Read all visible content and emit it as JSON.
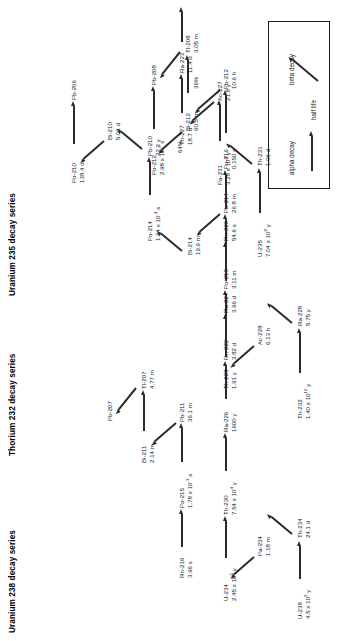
{
  "figure": {
    "orientation": "landscape-figure-rotated-90ccw",
    "background": "#ffffff",
    "line_color": "#2b2b2b",
    "text_color": "#1a1a1a"
  },
  "series": [
    {
      "id": "u238",
      "title": "Uranium 238 decay series",
      "nodes": [
        {
          "name": "U-238",
          "half_life": "4.5 x 10",
          "exp": "9",
          "unit": "y"
        },
        {
          "name": "Th-234",
          "half_life": "24.1 d"
        },
        {
          "name": "Pa-234",
          "half_life": "1.18 m"
        },
        {
          "name": "U-234",
          "half_life": "2.45 x 10",
          "exp": "5",
          "unit": "y"
        },
        {
          "name": "Th-230",
          "half_life": "7.54 x 10",
          "exp": "4",
          "unit": "y"
        },
        {
          "name": "Ra-226",
          "half_life": "1600 y"
        },
        {
          "name": "Rn-222",
          "half_life": "3.82 d"
        },
        {
          "name": "Po-218",
          "half_life": "3.11 m"
        },
        {
          "name": "Pb-214",
          "half_life": "26.8 m"
        },
        {
          "name": "Bi-214",
          "half_life": "19.9 m"
        },
        {
          "name": "Po-214",
          "half_life": "1.64 x 10",
          "exp": "-4",
          "unit": "s"
        },
        {
          "name": "Pb-210",
          "half_life": "22.3 y"
        },
        {
          "name": "Bi-210",
          "half_life": "5.01 d"
        },
        {
          "name": "Po-210",
          "half_life": "138.4 d"
        },
        {
          "name": "Pb-206",
          "half_life": ""
        }
      ]
    },
    {
      "id": "th232",
      "title": "Thorium 232 decay series",
      "nodes": [
        {
          "name": "Th-232",
          "half_life": "1.40 x 10",
          "exp": "10",
          "unit": "y"
        },
        {
          "name": "Ra-228",
          "half_life": "5.75 y"
        },
        {
          "name": "Ac-228",
          "half_life": "6.13 h"
        },
        {
          "name": "Th-228",
          "half_life": "1.91 y"
        },
        {
          "name": "Ra-224",
          "half_life": "3.66 d"
        },
        {
          "name": "Rn-220",
          "half_life": "54.6 s"
        },
        {
          "name": "Po-216",
          "half_life": "0.150 s"
        },
        {
          "name": "Pb-212",
          "half_life": "10.6 h"
        },
        {
          "name": "Bi-212",
          "half_life": "60.5 m"
        },
        {
          "name": "Po-212",
          "half_life": "2.98 x 10",
          "exp": "-7",
          "unit": "s"
        },
        {
          "name": "Tl-208",
          "half_life": "3.05 m"
        },
        {
          "name": "Pb-208",
          "half_life": ""
        }
      ],
      "branches": [
        {
          "label": "64%"
        },
        {
          "label": "36%"
        }
      ]
    },
    {
      "id": "u235",
      "title": "Uranium 235 decay series",
      "nodes": [
        {
          "name": "U-235",
          "half_life": "7.04 x 10",
          "exp": "8",
          "unit": "y"
        },
        {
          "name": "Th-231",
          "half_life": "1.06 d"
        },
        {
          "name": "Pa-231",
          "half_life": "3.28 x 10",
          "exp": "4",
          "unit": "y"
        },
        {
          "name": "Ac-227",
          "half_life": "21.8 y"
        },
        {
          "name": "Th-227",
          "half_life": "18.7 d"
        },
        {
          "name": "Ra-223",
          "half_life": "11.4 d"
        },
        {
          "name": "Rn-219",
          "half_life": "3.96 s"
        },
        {
          "name": "Po-215",
          "half_life": "1.78 x 10",
          "exp": "-3",
          "unit": "s"
        },
        {
          "name": "Pb-211",
          "half_life": "36.1 m"
        },
        {
          "name": "Bi-211",
          "half_life": "2.14 m"
        },
        {
          "name": "Tl-207",
          "half_life": "4.77 m"
        },
        {
          "name": "Pb-207",
          "half_life": ""
        }
      ]
    }
  ],
  "legend": {
    "alpha": "alpha decay",
    "beta": "beta decay",
    "half_life": "half life"
  }
}
